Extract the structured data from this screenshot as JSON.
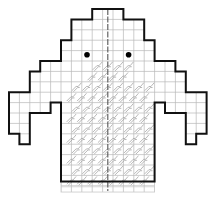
{
  "grid": {
    "origin_x": 9,
    "origin_y": 9,
    "cell": 10.4,
    "cols": 19,
    "rows": 18,
    "line_color": "#b8b8b8",
    "outline_color": "#111111",
    "pattern_color": "#9a9a9a"
  },
  "outline": {
    "head_and_arms": [
      [
        8,
        0
      ],
      [
        11,
        0
      ],
      [
        11,
        1
      ],
      [
        13,
        1
      ],
      [
        13,
        3
      ],
      [
        14,
        3
      ],
      [
        14,
        5
      ],
      [
        16,
        5
      ],
      [
        16,
        6
      ],
      [
        17,
        6
      ],
      [
        17,
        8
      ],
      [
        19,
        8
      ],
      [
        19,
        12
      ],
      [
        18,
        12
      ],
      [
        18,
        13
      ],
      [
        17,
        13
      ],
      [
        17,
        10
      ],
      [
        15,
        10
      ],
      [
        15,
        9
      ],
      [
        14,
        9
      ],
      [
        14,
        16.6
      ],
      [
        5,
        16.6
      ],
      [
        5,
        9
      ],
      [
        4,
        9
      ],
      [
        4,
        10
      ],
      [
        2,
        10
      ],
      [
        2,
        13
      ],
      [
        1,
        13
      ],
      [
        1,
        12
      ],
      [
        0,
        12
      ],
      [
        0,
        8
      ],
      [
        2,
        8
      ],
      [
        2,
        6
      ],
      [
        3,
        6
      ],
      [
        3,
        5
      ],
      [
        5,
        5
      ],
      [
        5,
        3
      ],
      [
        6,
        3
      ],
      [
        6,
        1
      ],
      [
        8,
        1
      ],
      [
        8,
        0
      ]
    ]
  },
  "eyes": [
    {
      "name": "left-eye",
      "col": 7.5,
      "row": 4.0
    },
    {
      "name": "right-eye",
      "col": 11.5,
      "row": 4.0
    }
  ],
  "center_line": {
    "col": 9.5,
    "from_row": 0,
    "to_row": 17.5
  },
  "pattern": {
    "symbol": "houndstooth-stitch",
    "region_rows_start": 5,
    "region_rows_end": 16.6,
    "left_col": 5,
    "right_col": 14,
    "top_area": {
      "from_col": 7.5,
      "to_col": 11.5,
      "from_row": 5,
      "to_row": 7
    }
  },
  "ribbing": {
    "from_row": 16.6,
    "to_row": 17.6,
    "from_col": 5,
    "to_col": 14
  }
}
